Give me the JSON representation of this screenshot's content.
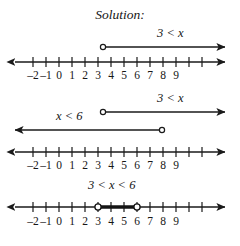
{
  "title": "Solution:",
  "axis": {
    "tick_labels": [
      "–2",
      "–1",
      "0",
      "1",
      "2",
      "3",
      "4",
      "5",
      "6",
      "7",
      "8",
      "9"
    ],
    "tick_values": [
      -2,
      -1,
      0,
      1,
      2,
      3,
      4,
      5,
      6,
      7,
      8,
      9
    ],
    "x_min": -2,
    "x_max": 9,
    "left_arrow": true,
    "right_arrow": true
  },
  "panels": [
    {
      "name": "first-inequality",
      "label": "3 < x",
      "graph": {
        "type": "ray-right",
        "endpoint_value": 3,
        "endpoint_style": "open-circle",
        "direction": "right",
        "arrow": true
      }
    },
    {
      "name": "two-inequalities",
      "labels": [
        "3 < x",
        "x < 6"
      ],
      "graphs": [
        {
          "type": "ray-right",
          "label": "3 < x",
          "endpoint_value": 3,
          "endpoint_style": "open-circle",
          "direction": "right",
          "arrow": true
        },
        {
          "type": "ray-left",
          "label": "x < 6",
          "endpoint_value": 6,
          "endpoint_style": "open-circle",
          "direction": "left",
          "arrow": true
        }
      ]
    },
    {
      "name": "compound-inequality",
      "label": "3 < x < 6",
      "graph": {
        "type": "segment",
        "start_value": 3,
        "end_value": 6,
        "start_style": "open-circle",
        "end_style": "open-circle",
        "bold": true
      }
    }
  ],
  "colors": {
    "ink": "#161616",
    "line": "#1a1a1a",
    "background": "#ffffff"
  }
}
